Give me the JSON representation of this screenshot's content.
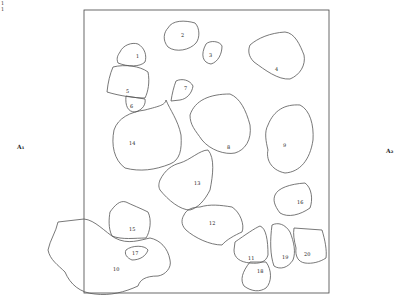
{
  "figure": {
    "corner_text": [
      "1",
      "1"
    ],
    "side_labels": {
      "left": "A₁",
      "right": "A₂"
    },
    "frame": {
      "x": 84,
      "y": 10,
      "width": 245,
      "height": 283
    },
    "stroke_color": "#555555",
    "regions": [
      {
        "id": "1",
        "label": "1",
        "x": 138,
        "y": 57
      },
      {
        "id": "2",
        "label": "2",
        "x": 183,
        "y": 36
      },
      {
        "id": "3",
        "label": "3",
        "x": 211,
        "y": 56
      },
      {
        "id": "4",
        "label": "4",
        "x": 277,
        "y": 70
      },
      {
        "id": "5",
        "label": "5",
        "x": 128,
        "y": 92
      },
      {
        "id": "6",
        "label": "6",
        "x": 132,
        "y": 107
      },
      {
        "id": "7",
        "label": "7",
        "x": 186,
        "y": 89
      },
      {
        "id": "8",
        "label": "8",
        "x": 229,
        "y": 148
      },
      {
        "id": "9",
        "label": "9",
        "x": 285,
        "y": 146
      },
      {
        "id": "14",
        "label": "14",
        "x": 131,
        "y": 144
      },
      {
        "id": "13",
        "label": "13",
        "x": 196,
        "y": 184
      },
      {
        "id": "16",
        "label": "16",
        "x": 299,
        "y": 203
      },
      {
        "id": "12",
        "label": "12",
        "x": 211,
        "y": 224
      },
      {
        "id": "15",
        "label": "15",
        "x": 131,
        "y": 230
      },
      {
        "id": "17",
        "label": "17",
        "x": 134,
        "y": 254
      },
      {
        "id": "10",
        "label": "10",
        "x": 115,
        "y": 270
      },
      {
        "id": "11",
        "label": "11",
        "x": 250,
        "y": 259
      },
      {
        "id": "19",
        "label": "19",
        "x": 284,
        "y": 258
      },
      {
        "id": "20",
        "label": "20",
        "x": 306,
        "y": 255
      },
      {
        "id": "18",
        "label": "18",
        "x": 259,
        "y": 272
      }
    ]
  }
}
